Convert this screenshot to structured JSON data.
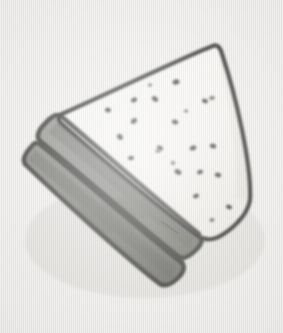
{
  "scene": {
    "title": "Hand-drawn sandwich sketch",
    "subject": "triangular sandwich half",
    "medium": "pencil sketch on textured paper",
    "width": 283,
    "height": 333,
    "caption": ""
  },
  "palette": {
    "paper_base": "#f2f1ef",
    "paper_weave_light": "#ffffff",
    "paper_weave_dark": "#cbc9c5",
    "outline_dark": "#3a3a3a",
    "outline_mid": "#5a5a58",
    "bread_face": "#fbfbfa",
    "bread_face_shade": "#eceae6",
    "filling_top": "#8a8a87",
    "filling_bottom": "#7c7c79",
    "filling_shadow": "#5f5f5c",
    "divider_line": "#4a4a48",
    "seed_dark": "#3c3c3a",
    "seed_mid": "#585856"
  },
  "shapes": {
    "bread_face_path": "M 213 45 L 60 115 L 200 232 Z",
    "filling_upper_path": "M 60 115 L 200 232 L 186 258 L 40 143 Z",
    "filling_lower_path": "M 40 143 L 186 258 L 170 282 L 26 163 Z",
    "outline_stroke_width": 4
  },
  "seeds": [
    {
      "cx": 176,
      "cy": 82,
      "rx": 3.6,
      "ry": 2.6,
      "rot": -18
    },
    {
      "cx": 205,
      "cy": 101,
      "rx": 3.0,
      "ry": 2.2,
      "rot": 22
    },
    {
      "cx": 155,
      "cy": 99,
      "rx": 3.4,
      "ry": 2.4,
      "rot": 35
    },
    {
      "cx": 134,
      "cy": 100,
      "rx": 3.2,
      "ry": 2.3,
      "rot": -30
    },
    {
      "cx": 108,
      "cy": 110,
      "rx": 3.0,
      "ry": 2.4,
      "rot": 10
    },
    {
      "cx": 134,
      "cy": 121,
      "rx": 3.4,
      "ry": 2.5,
      "rot": -40
    },
    {
      "cx": 175,
      "cy": 122,
      "rx": 3.2,
      "ry": 2.3,
      "rot": 18
    },
    {
      "cx": 120,
      "cy": 137,
      "rx": 3.3,
      "ry": 2.6,
      "rot": 45
    },
    {
      "cx": 131,
      "cy": 158,
      "rx": 3.0,
      "ry": 2.2,
      "rot": -12
    },
    {
      "cx": 160,
      "cy": 148,
      "rx": 3.2,
      "ry": 2.3,
      "rot": 28
    },
    {
      "cx": 158,
      "cy": 151,
      "rx": 2.6,
      "ry": 2.0,
      "rot": 0
    },
    {
      "cx": 193,
      "cy": 148,
      "rx": 3.4,
      "ry": 2.5,
      "rot": -22
    },
    {
      "cx": 213,
      "cy": 146,
      "rx": 3.2,
      "ry": 2.4,
      "rot": 16
    },
    {
      "cx": 212,
      "cy": 98,
      "rx": 2.8,
      "ry": 2.1,
      "rot": -8
    },
    {
      "cx": 178,
      "cy": 172,
      "rx": 3.6,
      "ry": 2.6,
      "rot": 30
    },
    {
      "cx": 200,
      "cy": 172,
      "rx": 3.0,
      "ry": 2.3,
      "rot": -25
    },
    {
      "cx": 173,
      "cy": 163,
      "rx": 2.4,
      "ry": 1.9,
      "rot": 0
    },
    {
      "cx": 218,
      "cy": 175,
      "rx": 3.2,
      "ry": 2.4,
      "rot": 12
    },
    {
      "cx": 196,
      "cy": 196,
      "rx": 3.0,
      "ry": 2.2,
      "rot": -18
    },
    {
      "cx": 229,
      "cy": 207,
      "rx": 3.0,
      "ry": 2.2,
      "rot": 20
    },
    {
      "cx": 212,
      "cy": 220,
      "rx": 2.6,
      "ry": 2.0,
      "rot": -10
    },
    {
      "cx": 240,
      "cy": 221,
      "rx": 2.4,
      "ry": 1.8,
      "rot": 0
    },
    {
      "cx": 150,
      "cy": 85,
      "rx": 2.2,
      "ry": 1.7,
      "rot": 0
    },
    {
      "cx": 186,
      "cy": 111,
      "rx": 2.2,
      "ry": 1.7,
      "rot": 0
    }
  ],
  "filling_marks": [
    {
      "x1": 60,
      "y1": 160,
      "x2": 74,
      "y2": 172
    },
    {
      "x1": 95,
      "y1": 190,
      "x2": 112,
      "y2": 204
    },
    {
      "x1": 120,
      "y1": 213,
      "x2": 133,
      "y2": 224
    },
    {
      "x1": 148,
      "y1": 196,
      "x2": 166,
      "y2": 206
    },
    {
      "x1": 104,
      "y1": 150,
      "x2": 118,
      "y2": 160
    },
    {
      "x1": 162,
      "y1": 222,
      "x2": 178,
      "y2": 233
    }
  ]
}
